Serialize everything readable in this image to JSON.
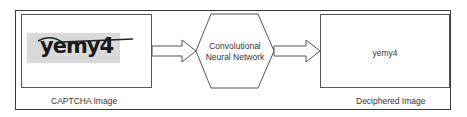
{
  "diagram": {
    "input": {
      "captcha_text": "yemy4",
      "label": "CAPTCHA Image"
    },
    "model": {
      "line1": "Convolutional",
      "line2": "Neural Network"
    },
    "output": {
      "text": "yemy4",
      "label": "Deciphered Image"
    },
    "colors": {
      "stroke": "#555555",
      "captcha_bg": "#d9d9d9"
    }
  }
}
